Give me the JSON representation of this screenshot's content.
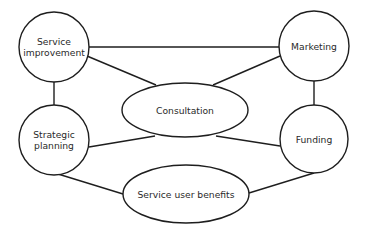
{
  "diagram": {
    "type": "network",
    "colors": {
      "stroke": "#1e1e1e",
      "fill": "#ffffff",
      "text": "#2a2a2a"
    },
    "nodes": [
      {
        "id": "service_improvement",
        "shape": "circle",
        "lines": [
          "Service",
          "improvement"
        ],
        "cx": 54,
        "cy": 47,
        "r": 35
      },
      {
        "id": "marketing",
        "shape": "circle",
        "lines": [
          "Marketing"
        ],
        "cx": 314,
        "cy": 46,
        "r": 35
      },
      {
        "id": "strategic_planning",
        "shape": "circle",
        "lines": [
          "Strategic",
          "planning"
        ],
        "cx": 54,
        "cy": 140,
        "r": 35
      },
      {
        "id": "funding",
        "shape": "circle",
        "lines": [
          "Funding"
        ],
        "cx": 314,
        "cy": 139,
        "r": 34
      },
      {
        "id": "consultation",
        "shape": "ellipse",
        "lines": [
          "Consultation"
        ],
        "cx": 185,
        "cy": 110,
        "rx": 63,
        "ry": 27
      },
      {
        "id": "service_user_benefits",
        "shape": "ellipse",
        "lines": [
          "Service user benefits"
        ],
        "cx": 186,
        "cy": 194,
        "rx": 63,
        "ry": 29
      }
    ],
    "edges": [
      {
        "from": "service_improvement",
        "to": "marketing",
        "x1": 89,
        "y1": 47,
        "x2": 279,
        "y2": 47
      },
      {
        "from": "service_improvement",
        "to": "consultation",
        "x1": 87,
        "y1": 56,
        "x2": 156,
        "y2": 85
      },
      {
        "from": "marketing",
        "to": "consultation",
        "x1": 280,
        "y1": 56,
        "x2": 213,
        "y2": 85
      },
      {
        "from": "service_improvement",
        "to": "strategic_planning",
        "x1": 54,
        "y1": 82,
        "x2": 54,
        "y2": 105
      },
      {
        "from": "marketing",
        "to": "funding",
        "x1": 314,
        "y1": 81,
        "x2": 314,
        "y2": 105
      },
      {
        "from": "strategic_planning",
        "to": "consultation",
        "x1": 89,
        "y1": 147,
        "x2": 155,
        "y2": 136
      },
      {
        "from": "consultation",
        "to": "funding",
        "x1": 216,
        "y1": 136,
        "x2": 280,
        "y2": 146
      },
      {
        "from": "strategic_planning",
        "to": "service_user_benefits",
        "x1": 58,
        "y1": 174,
        "x2": 123,
        "y2": 194
      },
      {
        "from": "service_user_benefits",
        "to": "funding",
        "x1": 249,
        "y1": 193,
        "x2": 314,
        "y2": 173
      }
    ]
  }
}
